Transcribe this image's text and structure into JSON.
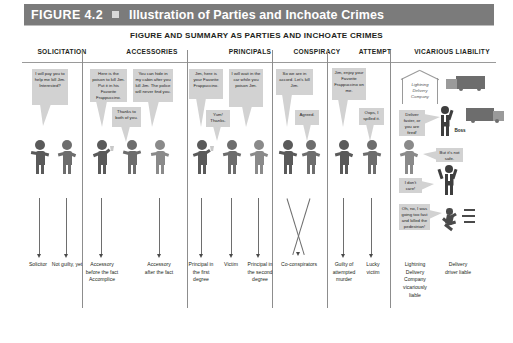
{
  "figure": {
    "number": "FIGURE 4.2",
    "title": "Illustration of Parties and Inchoate Crimes",
    "subtitle": "FIGURE AND SUMMARY AS PARTIES AND INCHOATE CRIMES",
    "bar_color": "#7b7b7b",
    "bubble_color": "#d2d2d2",
    "figure_color": "#6d6d6d"
  },
  "columns": [
    {
      "id": "solicitation",
      "header": "SOLICITATION"
    },
    {
      "id": "accessories",
      "header": "ACCESSORIES"
    },
    {
      "id": "principals",
      "header": "PRINCIPALS"
    },
    {
      "id": "conspiracy",
      "header": "CONSPIRACY"
    },
    {
      "id": "attempt",
      "header": "ATTEMPT"
    },
    {
      "id": "vicarious-liability",
      "header": "VICARIOUS LIABILITY"
    }
  ],
  "bubbles": {
    "solicit_offer": "I will pay you to help me kill Jim. Interested?",
    "accessory_before": "Here is the poison to kill Jim. Put it in his Favorite Frappuccino.",
    "accessory_after": "You can hide in my cabin after you kill Jim. The police will never find you.",
    "thanks_both": "Thanks to both of you.",
    "principal_first": "Jim, here is your Favorite Frappuccino.",
    "victim_yum": "Yum! Thanks.",
    "principal_second": "I will wait in the car while you poison Jim.",
    "conspiracy_accord": "So we are in accord. Let's kill Jim.",
    "conspiracy_agreed": "Agreed.",
    "attempt_offer": "Jim, enjoy your Favorite Frappuccino on me.",
    "attempt_spilled": "Oops, I spilled it.",
    "boss_order": "Deliver faster, or you are fired!",
    "driver_unsafe": "But it's not safe.",
    "boss_dontcare": "I don't care!",
    "driver_crash": "Oh, no, I was going too fast and killed the pedestrian!"
  },
  "art_labels": {
    "company_sign": "Lightning Delivery Company",
    "boss": "Boss"
  },
  "outcomes": [
    {
      "id": "solicitor",
      "text": "Solicitor"
    },
    {
      "id": "not-guilty-yet",
      "text": "Not guilty, yet"
    },
    {
      "id": "accessory-before",
      "text": "Accessory before the fact Accomplice"
    },
    {
      "id": "accessory-after",
      "text": "Accessory after the fact"
    },
    {
      "id": "principal-first",
      "text": "Principal in the first degree"
    },
    {
      "id": "victim",
      "text": "Victim"
    },
    {
      "id": "principal-second",
      "text": "Principal in the second degree"
    },
    {
      "id": "co-conspirators",
      "text": "Co-conspirators"
    },
    {
      "id": "attempted-murder",
      "text": "Guilty of attempted murder"
    },
    {
      "id": "lucky-victim",
      "text": "Lucky victim"
    },
    {
      "id": "company-liable",
      "text": "Lightning Delivery Company vicariously liable"
    },
    {
      "id": "driver-liable",
      "text": "Delivery driver liable"
    }
  ]
}
